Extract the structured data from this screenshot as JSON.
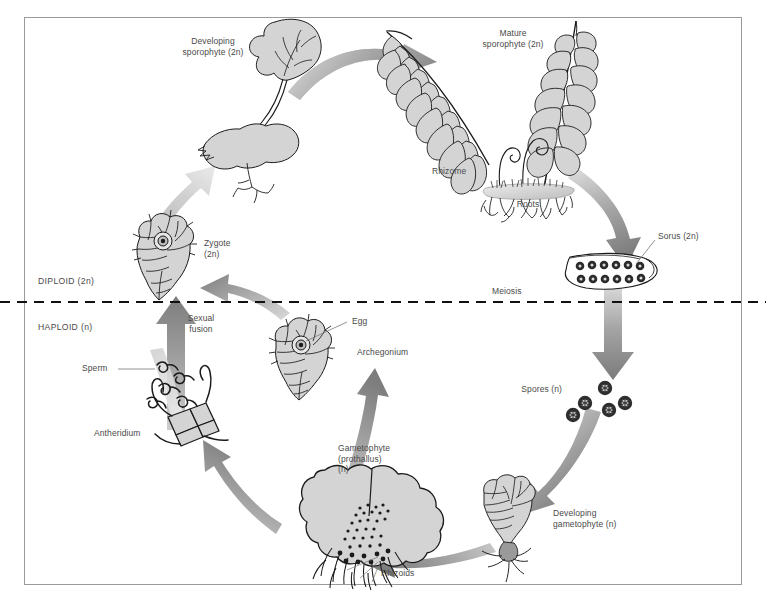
{
  "figure": {
    "frame_border_color": "#9a9a9a",
    "background": "#ffffff",
    "arrow_color_dark": "#7d7d7d",
    "arrow_color_light": "#d8d8d8",
    "tissue_fill": "#d4d4d4",
    "outline_color": "#1b1b1b",
    "text_color": "#4a4a4a"
  },
  "phase_divider": {
    "style": "dashed",
    "y": 302,
    "color": "#111111",
    "upper_label": "DIPLOID (2n)",
    "lower_label": "HAPLOID (n)"
  },
  "labels": {
    "developing_sporophyte": "Developing\nsporophyte (2n)",
    "mature_sporophyte": "Mature\nsporophyte (2n)",
    "rhizome": "Rhizome",
    "roots": "Roots",
    "sorus": "Sorus (2n)",
    "meiosis": "Meiosis",
    "spores": "Spores (n)",
    "developing_gametophyte": "Developing\ngametophyte (n)",
    "gametophyte": "Gametophyte\n(prothallus)\n(n)",
    "rhizoids": "Rhizoids",
    "antheridium": "Antheridium",
    "sperm": "Sperm",
    "archegonium": "Archegonium",
    "egg": "Egg",
    "sexual_fusion": "Sexual\nfusion",
    "zygote": "Zygote\n(2n)",
    "diploid": "DIPLOID (2n)",
    "haploid": "HAPLOID (n)"
  },
  "stages": [
    {
      "id": "zygote",
      "label": "Zygote (2n)",
      "ploidy": "2n",
      "phase": "diploid"
    },
    {
      "id": "developing-sporophyte",
      "label": "Developing sporophyte (2n)",
      "ploidy": "2n",
      "phase": "diploid"
    },
    {
      "id": "mature-sporophyte",
      "label": "Mature sporophyte (2n)",
      "ploidy": "2n",
      "phase": "diploid"
    },
    {
      "id": "sorus",
      "label": "Sorus (2n)",
      "ploidy": "2n",
      "phase": "diploid"
    },
    {
      "id": "spores",
      "label": "Spores (n)",
      "ploidy": "n",
      "phase": "haploid"
    },
    {
      "id": "developing-gametophyte",
      "label": "Developing gametophyte (n)",
      "ploidy": "n",
      "phase": "haploid"
    },
    {
      "id": "gametophyte",
      "label": "Gametophyte (prothallus) (n)",
      "ploidy": "n",
      "phase": "haploid"
    },
    {
      "id": "antheridium",
      "label": "Antheridium",
      "ploidy": "n",
      "phase": "haploid"
    },
    {
      "id": "archegonium",
      "label": "Archegonium",
      "ploidy": "n",
      "phase": "haploid"
    }
  ],
  "processes": [
    {
      "id": "meiosis",
      "label": "Meiosis"
    },
    {
      "id": "sexual-fusion",
      "label": "Sexual fusion"
    }
  ],
  "parts": [
    {
      "id": "rhizome",
      "label": "Rhizome"
    },
    {
      "id": "roots",
      "label": "Roots"
    },
    {
      "id": "rhizoids",
      "label": "Rhizoids"
    },
    {
      "id": "sperm",
      "label": "Sperm"
    },
    {
      "id": "egg",
      "label": "Egg"
    }
  ],
  "counts": {
    "spores_drawn": 5,
    "sorus_rows": 2,
    "sorus_dots_per_row": 6,
    "fronds": 2,
    "fiddleheads": 2
  }
}
